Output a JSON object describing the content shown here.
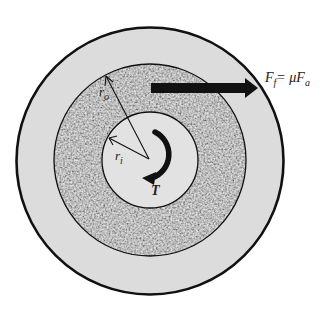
{
  "diagram": {
    "labels": {
      "outer_radius": "r",
      "outer_radius_sub": "o",
      "inner_radius": "r",
      "inner_radius_sub": "i",
      "torque": "T",
      "friction_force": "F",
      "friction_force_sub": "f",
      "friction_eq": "= μF",
      "friction_eq_sub": "a"
    },
    "colors": {
      "outer_disc": "#dcdcdc",
      "friction_ring": "#8e8e8e",
      "inner_disc": "#e2e2e2",
      "stroke": "#111111",
      "background": "#ffffff"
    }
  }
}
